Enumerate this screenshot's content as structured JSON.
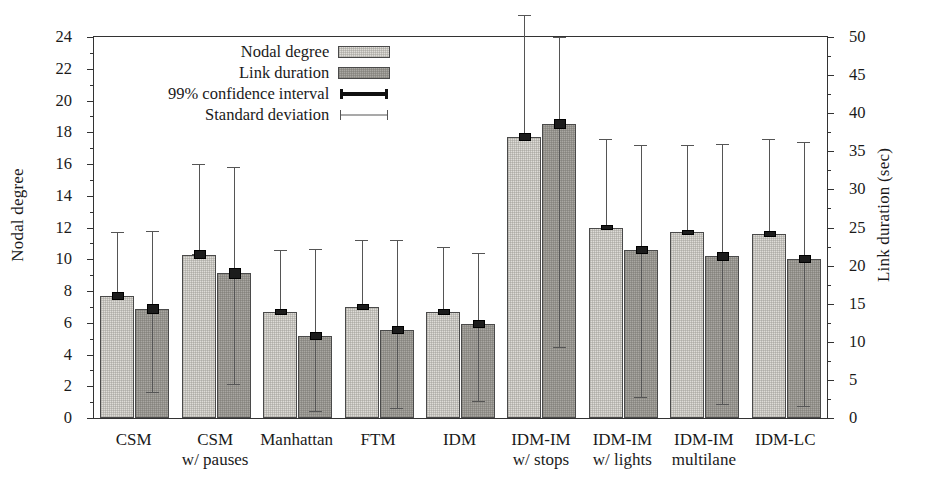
{
  "chart_data": {
    "type": "bar",
    "title": "",
    "subtitle": "",
    "xlabel": "",
    "ylabel": "Nodal degree",
    "ylabel_right": "Link duration (sec)",
    "ylim": [
      0,
      24
    ],
    "ylim_right": [
      0,
      50
    ],
    "ytick_step": 2,
    "ytick_step_right": 5,
    "yticks": [
      0,
      2,
      4,
      6,
      8,
      10,
      12,
      14,
      16,
      18,
      20,
      22,
      24
    ],
    "yticks_right": [
      0,
      5,
      10,
      15,
      20,
      25,
      30,
      35,
      40,
      45,
      50
    ],
    "grid": false,
    "legend_position": "top-center",
    "legend": [
      {
        "label": "Nodal degree",
        "marker": "bar-light"
      },
      {
        "label": "Link duration",
        "marker": "bar-dark"
      },
      {
        "label": "99% confidence interval",
        "marker": "thick-line-caps"
      },
      {
        "label": "Standard deviation",
        "marker": "thin-line-caps"
      }
    ],
    "categories": [
      {
        "line1": "CSM",
        "line2": ""
      },
      {
        "line1": "CSM",
        "line2": "w/ pauses"
      },
      {
        "line1": "Manhattan",
        "line2": ""
      },
      {
        "line1": "FTM",
        "line2": ""
      },
      {
        "line1": "IDM",
        "line2": ""
      },
      {
        "line1": "IDM-IM",
        "line2": "w/ stops"
      },
      {
        "line1": "IDM-IM",
        "line2": "w/ lights"
      },
      {
        "line1": "IDM-IM",
        "line2": "multilane"
      },
      {
        "line1": "IDM-LC",
        "line2": ""
      }
    ],
    "series": [
      {
        "name": "Nodal degree",
        "axis": "left",
        "unit": "",
        "values": [
          7.7,
          10.3,
          6.7,
          7.0,
          6.7,
          17.7,
          12.0,
          11.7,
          11.6
        ],
        "ci_low": [
          7.5,
          10.1,
          6.6,
          6.9,
          6.6,
          17.5,
          11.9,
          11.6,
          11.5
        ],
        "ci_high": [
          7.9,
          10.5,
          6.8,
          7.1,
          6.8,
          17.9,
          12.1,
          11.8,
          11.7
        ],
        "sd_low": [
          7.7,
          10.3,
          6.7,
          7.0,
          6.7,
          17.7,
          12.0,
          11.7,
          11.6
        ],
        "sd_high": [
          11.7,
          16.0,
          10.6,
          11.2,
          10.8,
          25.4,
          17.6,
          17.2,
          17.6
        ]
      },
      {
        "name": "Link duration",
        "axis": "right",
        "unit": "sec",
        "values": [
          14.3,
          19.0,
          10.8,
          11.6,
          12.3,
          38.6,
          22.1,
          21.2,
          20.9
        ],
        "ci_low": [
          13.8,
          18.4,
          10.4,
          11.2,
          11.9,
          38.1,
          21.7,
          20.8,
          20.5
        ],
        "ci_high": [
          14.8,
          19.6,
          11.2,
          12.0,
          12.7,
          39.1,
          22.5,
          21.6,
          21.3
        ],
        "sd_low": [
          3.4,
          4.5,
          0.9,
          1.3,
          2.2,
          9.3,
          2.8,
          1.9,
          1.6
        ],
        "sd_high": [
          24.5,
          33.0,
          22.2,
          23.4,
          21.6,
          50.0,
          35.8,
          36.0,
          36.2
        ]
      }
    ]
  },
  "figure": {
    "background": "#ffffff",
    "bar_color_nodal": "#dedcd7",
    "bar_color_link": "#a9a7a2",
    "axis_color": "#333333",
    "error_color": "#555555",
    "ci_color": "#1c1c1c"
  }
}
